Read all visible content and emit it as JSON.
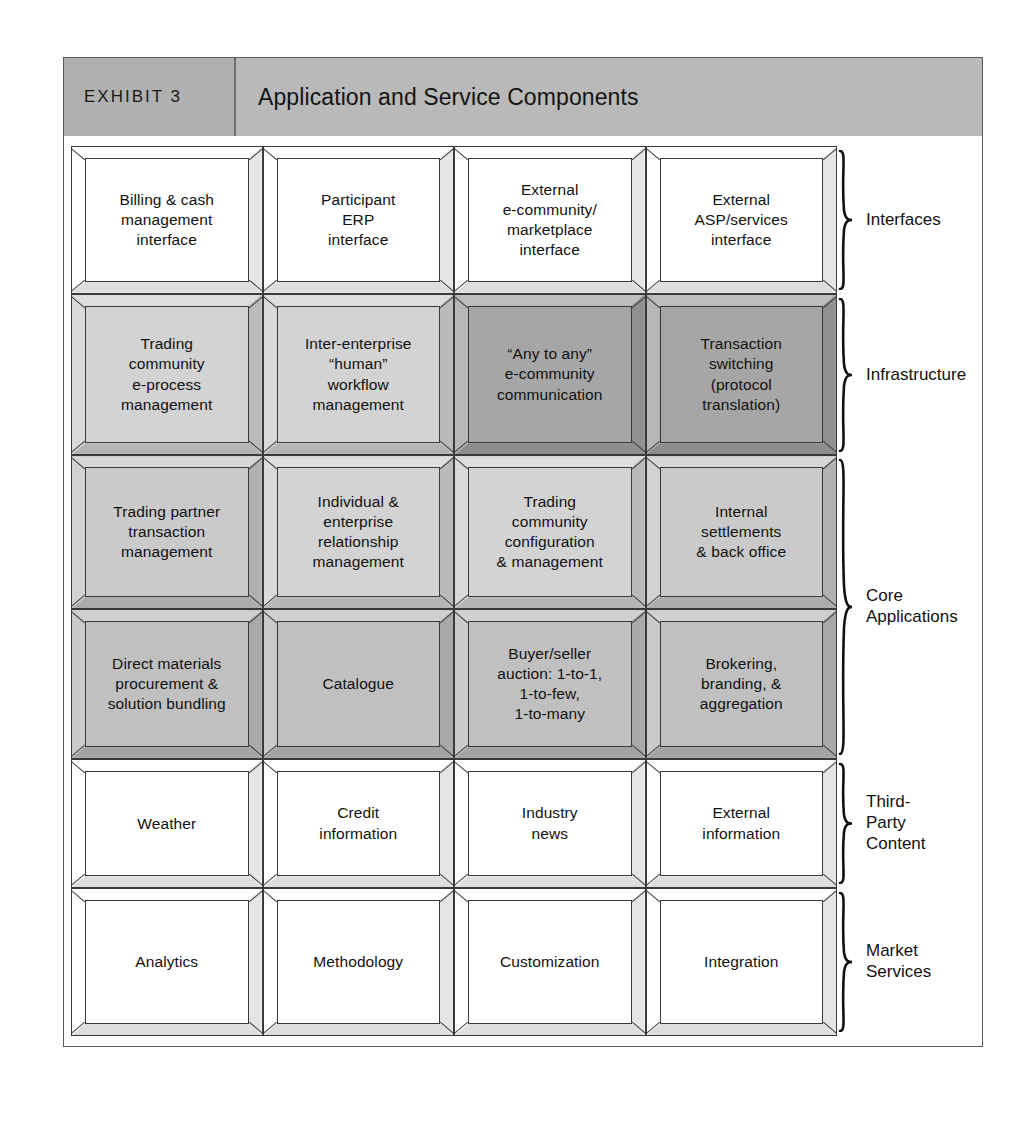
{
  "exhibit": {
    "tag": "EXHIBIT 3",
    "title": "Application and Service Components"
  },
  "colors": {
    "header_band": "#b9b9b9",
    "tag_band": "#b0b0b0",
    "cell_white": "#ffffff",
    "cell_light": "#d3d3d3",
    "cell_light2": "#cacaca",
    "cell_medium": "#c0c0c0",
    "cell_dark": "#a6a6a6",
    "outline": "#3a3a3a",
    "text": "#111111"
  },
  "matrix": {
    "columns": 4,
    "rows": [
      {
        "id": "interfaces",
        "cells": [
          {
            "label": "Billing & cash\nmanagement\ninterface",
            "tint": "tint-white"
          },
          {
            "label": "Participant\nERP\ninterface",
            "tint": "tint-white"
          },
          {
            "label": "External\ne-community/\nmarketplace\ninterface",
            "tint": "tint-white"
          },
          {
            "label": "External\nASP/services\ninterface",
            "tint": "tint-white"
          }
        ]
      },
      {
        "id": "infrastructure",
        "cells": [
          {
            "label": "Trading\ncommunity\ne-process\nmanagement",
            "tint": "tint-light"
          },
          {
            "label": "Inter-enterprise\n“human”\nworkflow\nmanagement",
            "tint": "tint-light"
          },
          {
            "label": "“Any to any”\ne-community\ncommunication",
            "tint": "tint-dark"
          },
          {
            "label": "Transaction\nswitching\n(protocol\ntranslation)",
            "tint": "tint-dark"
          }
        ]
      },
      {
        "id": "core-applications-upper",
        "cells": [
          {
            "label": "Trading partner\ntransaction\nmanagement",
            "tint": "tint-light2"
          },
          {
            "label": "Individual &\nenterprise\nrelationship\nmanagement",
            "tint": "tint-light"
          },
          {
            "label": "Trading\ncommunity\nconfiguration\n& management",
            "tint": "tint-light"
          },
          {
            "label": "Internal\nsettlements\n& back office",
            "tint": "tint-light2"
          }
        ]
      },
      {
        "id": "core-applications-lower",
        "cells": [
          {
            "label": "Direct materials\nprocurement &\nsolution bundling",
            "tint": "tint-med"
          },
          {
            "label": "Catalogue",
            "tint": "tint-med"
          },
          {
            "label": "Buyer/seller\nauction: 1-to-1,\n1-to-few,\n1-to-many",
            "tint": "tint-med"
          },
          {
            "label": "Brokering,\nbranding, &\naggregation",
            "tint": "tint-med"
          }
        ]
      },
      {
        "id": "third-party-content",
        "cells": [
          {
            "label": "Weather",
            "tint": "tint-white"
          },
          {
            "label": "Credit\ninformation",
            "tint": "tint-white"
          },
          {
            "label": "Industry\nnews",
            "tint": "tint-white"
          },
          {
            "label": "External\ninformation",
            "tint": "tint-white"
          }
        ]
      },
      {
        "id": "market-services",
        "cells": [
          {
            "label": "Analytics",
            "tint": "tint-white"
          },
          {
            "label": "Methodology",
            "tint": "tint-white"
          },
          {
            "label": "Customization",
            "tint": "tint-white"
          },
          {
            "label": "Integration",
            "tint": "tint-white"
          }
        ]
      }
    ]
  },
  "groups": [
    {
      "label": "Interfaces",
      "rows": 1
    },
    {
      "label": "Infrastructure",
      "rows": 1
    },
    {
      "label": "Core\nApplications",
      "rows": 2
    },
    {
      "label": "Third-\nParty\nContent",
      "rows": 1
    },
    {
      "label": "Market\nServices",
      "rows": 1
    }
  ]
}
